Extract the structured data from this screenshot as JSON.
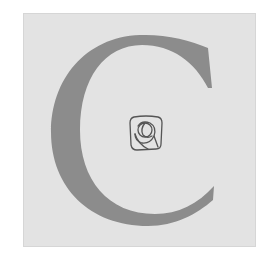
{
  "drop_cap": {
    "letter": "C",
    "fill_color": "#8c8c8c",
    "background_color": "#e3e3e3"
  },
  "emblem": {
    "icon": "rose-icon",
    "stroke_color": "#555555"
  }
}
